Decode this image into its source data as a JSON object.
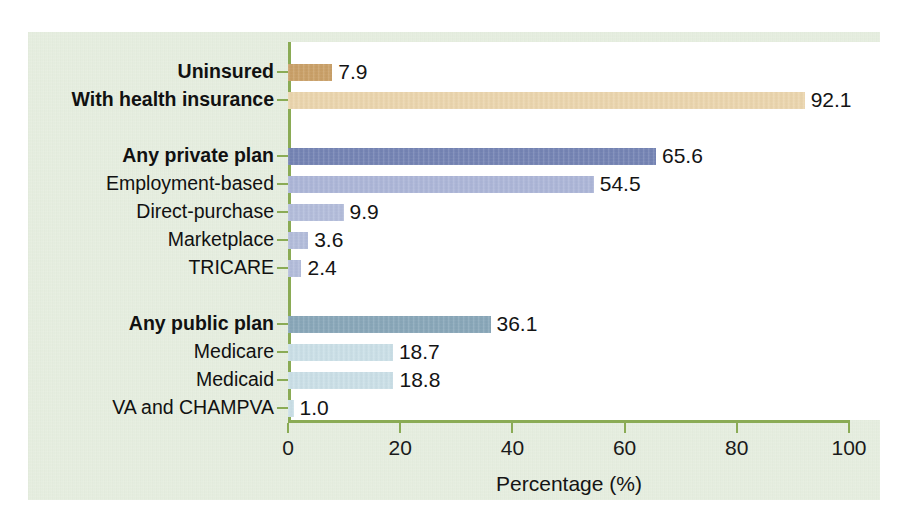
{
  "chart_data": {
    "type": "bar",
    "orientation": "horizontal",
    "title": "",
    "xlabel": "Percentage (%)",
    "ylabel": "",
    "xlim": [
      0,
      100
    ],
    "xticks": [
      0,
      20,
      40,
      60,
      80,
      100
    ],
    "xtick_labels": [
      "0",
      "20",
      "40",
      "60",
      "80",
      "100"
    ],
    "grid": false,
    "legend": "none",
    "categories": [
      "Uninsured",
      "With health insurance",
      "Any private plan",
      "Employment-based",
      "Direct-purchase",
      "Marketplace",
      "TRICARE",
      "Any public plan",
      "Medicare",
      "Medicaid",
      "VA and CHAMPVA"
    ],
    "values": [
      7.9,
      92.1,
      65.6,
      54.5,
      9.9,
      3.6,
      2.4,
      36.1,
      18.7,
      18.8,
      1.0
    ],
    "value_labels": [
      "7.9",
      "92.1",
      "65.6",
      "54.5",
      "9.9",
      "3.6",
      "2.4",
      "36.1",
      "18.7",
      "18.8",
      "1.0"
    ]
  },
  "colors": {
    "panel_background": "#e2ebdb",
    "plot_background": "#ffffff",
    "axis": "#8aab55",
    "text": "#141414",
    "uninsured": "#c69a5e",
    "with_insurance": "#e9d2a8",
    "any_private_plan": "#6c7caf",
    "employment_based": "#a7b1d5",
    "private_sub": "#aeb8d8",
    "any_public_plan": "#81a1b4",
    "public_sub": "#c7dde5"
  },
  "bars": [
    {
      "label": "Uninsured",
      "value": 7.9,
      "value_label": "7.9",
      "bold": true,
      "color": "#c69a5e",
      "row": 0
    },
    {
      "label": "With health insurance",
      "value": 92.1,
      "value_label": "92.1",
      "bold": true,
      "color": "#e9d2a8",
      "row": 1
    },
    {
      "label": "Any private plan",
      "value": 65.6,
      "value_label": "65.6",
      "bold": true,
      "color": "#6c7caf",
      "row": 3
    },
    {
      "label": "Employment-based",
      "value": 54.5,
      "value_label": "54.5",
      "bold": false,
      "color": "#a7b1d5",
      "row": 4
    },
    {
      "label": "Direct-purchase",
      "value": 9.9,
      "value_label": "9.9",
      "bold": false,
      "color": "#aeb8d8",
      "row": 5
    },
    {
      "label": "Marketplace",
      "value": 3.6,
      "value_label": "3.6",
      "bold": false,
      "color": "#aeb8d8",
      "row": 6
    },
    {
      "label": "TRICARE",
      "value": 2.4,
      "value_label": "2.4",
      "bold": false,
      "color": "#aeb8d8",
      "row": 7
    },
    {
      "label": "Any public plan",
      "value": 36.1,
      "value_label": "36.1",
      "bold": true,
      "color": "#81a1b4",
      "row": 9
    },
    {
      "label": "Medicare",
      "value": 18.7,
      "value_label": "18.7",
      "bold": false,
      "color": "#c7dde5",
      "row": 10
    },
    {
      "label": "Medicaid",
      "value": 18.8,
      "value_label": "18.8",
      "bold": false,
      "color": "#c7dde5",
      "row": 11
    },
    {
      "label": "VA and CHAMPVA",
      "value": 1.0,
      "value_label": "1.0",
      "bold": false,
      "color": "#c7dde5",
      "row": 12
    }
  ],
  "axis": {
    "x_title": "Percentage (%)",
    "x_tick_labels": [
      "0",
      "20",
      "40",
      "60",
      "80",
      "100"
    ]
  }
}
